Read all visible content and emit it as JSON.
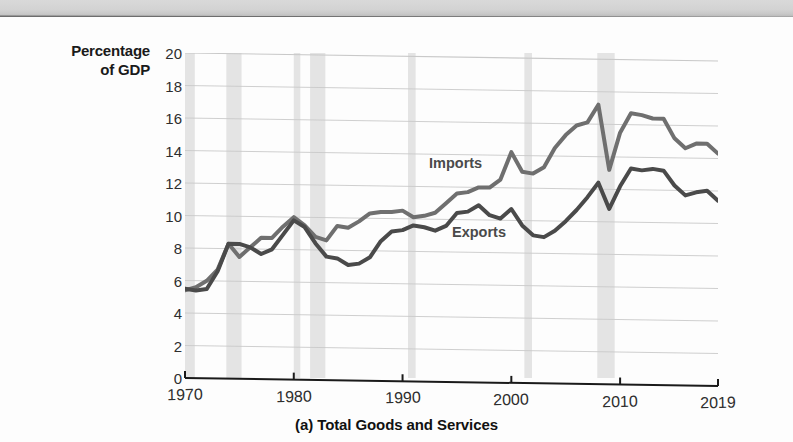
{
  "figure": {
    "caption": "(a) Total Goods and Services",
    "y_axis_title_line1": "Percentage",
    "y_axis_title_line2": "of GDP",
    "series_labels": {
      "imports": "Imports",
      "exports": "Exports"
    }
  },
  "colors": {
    "imports_line": "#6f6f6f",
    "exports_line": "#4a4a4a",
    "gridline": "#c9c9c9",
    "axis": "#1a1a1a",
    "recession_band": "#e4e4e4",
    "page": "#fdfdfd",
    "scan_edge": "#cfcfcf"
  },
  "chart_data": {
    "type": "line",
    "title": "(a) Total Goods and Services",
    "xlabel": "",
    "ylabel": "Percentage of GDP",
    "xlim": [
      1970,
      2019
    ],
    "ylim": [
      0,
      20
    ],
    "ytick_values": [
      0,
      2,
      4,
      6,
      8,
      10,
      12,
      14,
      16,
      18,
      20
    ],
    "xtick_values": [
      1970,
      1980,
      1990,
      2000,
      2010,
      2019
    ],
    "xtick_labels": [
      "1970",
      "1980",
      "1990",
      "2000",
      "2010",
      "2019"
    ],
    "grid": "horizontal",
    "legend": "inline-annotations",
    "x": [
      1970,
      1971,
      1972,
      1973,
      1974,
      1975,
      1976,
      1977,
      1978,
      1979,
      1980,
      1981,
      1982,
      1983,
      1984,
      1985,
      1986,
      1987,
      1988,
      1989,
      1990,
      1991,
      1992,
      1993,
      1994,
      1995,
      1996,
      1997,
      1998,
      1999,
      2000,
      2001,
      2002,
      2003,
      2004,
      2005,
      2006,
      2007,
      2008,
      2009,
      2010,
      2011,
      2012,
      2013,
      2014,
      2015,
      2016,
      2017,
      2018,
      2019
    ],
    "series": [
      {
        "name": "Imports",
        "values": [
          5.4,
          5.6,
          6.0,
          6.7,
          8.3,
          7.5,
          8.1,
          8.7,
          8.7,
          9.4,
          10.0,
          9.5,
          8.8,
          8.6,
          9.5,
          9.4,
          9.8,
          10.3,
          10.4,
          10.4,
          10.5,
          10.1,
          10.2,
          10.4,
          11.0,
          11.6,
          11.7,
          12.0,
          12.0,
          12.5,
          14.2,
          13.0,
          12.9,
          13.3,
          14.5,
          15.3,
          15.9,
          16.1,
          17.2,
          13.2,
          15.5,
          16.7,
          16.6,
          16.4,
          16.4,
          15.2,
          14.6,
          14.9,
          14.9,
          14.3
        ]
      },
      {
        "name": "Exports",
        "values": [
          5.5,
          5.4,
          5.5,
          6.6,
          8.3,
          8.3,
          8.1,
          7.7,
          8.0,
          8.9,
          9.8,
          9.4,
          8.4,
          7.6,
          7.5,
          7.1,
          7.2,
          7.6,
          8.6,
          9.2,
          9.3,
          9.6,
          9.5,
          9.3,
          9.6,
          10.4,
          10.5,
          10.9,
          10.3,
          10.1,
          10.7,
          9.7,
          9.1,
          9.0,
          9.4,
          10.0,
          10.7,
          11.5,
          12.4,
          10.8,
          12.2,
          13.3,
          13.2,
          13.3,
          13.2,
          12.3,
          11.7,
          11.9,
          12.0,
          11.4
        ]
      }
    ],
    "recession_bands": [
      {
        "start": 1969.9,
        "end": 1970.9
      },
      {
        "start": 1973.8,
        "end": 1975.2
      },
      {
        "start": 1980.0,
        "end": 1980.6
      },
      {
        "start": 1981.5,
        "end": 1982.9
      },
      {
        "start": 1990.5,
        "end": 1991.2
      },
      {
        "start": 2001.2,
        "end": 2001.9
      },
      {
        "start": 2007.9,
        "end": 2009.5
      }
    ]
  }
}
